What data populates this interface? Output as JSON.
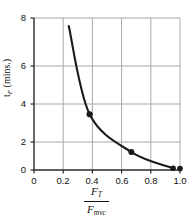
{
  "chart_data": {
    "type": "line",
    "title": "",
    "subtitle": "",
    "xlabel": "F_T / F_mvc",
    "xlabel_numerator": "F",
    "xlabel_numerator_sub": "T",
    "xlabel_denominator": "F",
    "xlabel_denominator_sub": "mvc",
    "ylabel": "t",
    "ylabel_sub": "F",
    "ylabel_units": " (mins.)",
    "x": [
      0.25,
      0.4,
      0.7,
      1.0
    ],
    "values": [
      8.0,
      3.1,
      1.0,
      0.1
    ],
    "series": [
      {
        "name": "fatigue-time",
        "x": [
          0.25,
          0.4,
          0.7,
          1.0
        ],
        "values": [
          8.0,
          3.1,
          1.0,
          0.1
        ]
      }
    ],
    "xlim": [
      0,
      1.05
    ],
    "ylim": [
      0,
      8.45
    ],
    "xticks": [
      0,
      0.2,
      0.4,
      0.6,
      0.8,
      1.0
    ],
    "xtick_labels": [
      "0",
      "0.2",
      "0.4",
      "0.6",
      "0.8",
      "1.0"
    ],
    "yticks": [
      0,
      2,
      4,
      6,
      8
    ],
    "ytick_labels": [
      "0",
      "2",
      "4",
      "6",
      "8"
    ],
    "grid": true,
    "legend": false,
    "legend_position": "none",
    "marker": "filled-circle",
    "line_color": "#1a1a1a",
    "marker_color": "#1a1a1a",
    "grid_color": "#a8a8a8",
    "axis_color": "#2b2b2b",
    "background": "#ffffff",
    "curve_path": "M 71.2 18.0 C 74.5 40.0, 80.5 82.0, 92.0 108.5 C 100.0 126.0, 118.0 142.5, 136.0 151.5 C 150.0 158.5, 166.0 165.0, 180.0 168.6"
  }
}
